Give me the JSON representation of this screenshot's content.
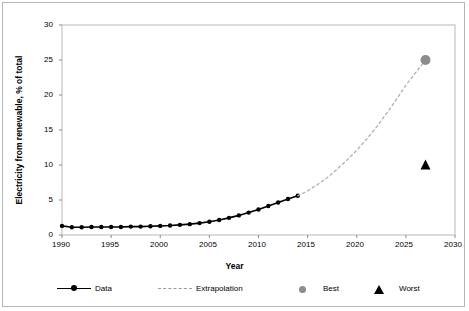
{
  "chart_data": {
    "type": "line",
    "title": "",
    "xlabel": "Year",
    "ylabel": "Electricity from renewable, % of total",
    "xlim": [
      1990,
      2030
    ],
    "ylim": [
      0,
      30
    ],
    "xticks": [
      1990,
      1995,
      2000,
      2005,
      2010,
      2015,
      2020,
      2025,
      2030
    ],
    "yticks": [
      0,
      5,
      10,
      15,
      20,
      25,
      30
    ],
    "grid": false,
    "legend_position": "bottom",
    "series": [
      {
        "name": "Data",
        "style": "solid-line-with-markers",
        "color": "#000000",
        "x": [
          1990,
          1991,
          1992,
          1993,
          1994,
          1995,
          1996,
          1997,
          1998,
          1999,
          2000,
          2001,
          2002,
          2003,
          2004,
          2005,
          2006,
          2007,
          2008,
          2009,
          2010,
          2011,
          2012,
          2013,
          2014
        ],
        "values": [
          1.3,
          1.1,
          1.1,
          1.15,
          1.15,
          1.15,
          1.15,
          1.2,
          1.2,
          1.25,
          1.3,
          1.35,
          1.45,
          1.55,
          1.7,
          1.9,
          2.15,
          2.45,
          2.8,
          3.2,
          3.65,
          4.15,
          4.65,
          5.15,
          5.6
        ]
      },
      {
        "name": "Extrapolation",
        "style": "dashed-line",
        "color": "#b0b0b0",
        "x": [
          2014,
          2015,
          2016,
          2017,
          2018,
          2019,
          2020,
          2021,
          2022,
          2023,
          2024,
          2025,
          2026,
          2027
        ],
        "values": [
          5.6,
          6.3,
          7.2,
          8.2,
          9.4,
          10.7,
          12.1,
          13.7,
          15.4,
          17.3,
          19.3,
          21.4,
          23.2,
          25.0
        ]
      },
      {
        "name": "Best",
        "style": "marker-circle",
        "color": "#8c8c8c",
        "x": [
          2027
        ],
        "values": [
          25.0
        ]
      },
      {
        "name": "Worst",
        "style": "marker-triangle",
        "color": "#000000",
        "x": [
          2027
        ],
        "values": [
          10.0
        ]
      }
    ],
    "legend": [
      {
        "label": "Data",
        "marker": "solid-line-dot",
        "color": "#000000"
      },
      {
        "label": "Extrapolation",
        "marker": "dashed-line",
        "color": "#9a9a9a"
      },
      {
        "label": "Best",
        "marker": "circle",
        "color": "#8c8c8c"
      },
      {
        "label": "Worst",
        "marker": "triangle",
        "color": "#000000"
      }
    ]
  }
}
